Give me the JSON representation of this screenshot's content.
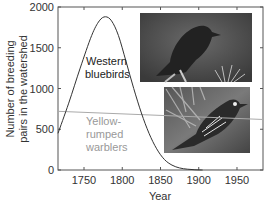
{
  "chart_data": {
    "type": "line",
    "title": "",
    "xlabel": "Year",
    "ylabel": "Number of breeding pairs in the watershed",
    "ylabel_lines": [
      "Number of breeding",
      "pairs in the watershed"
    ],
    "xlim": [
      1716,
      1984
    ],
    "ylim": [
      0,
      2000
    ],
    "xticks": [
      1750,
      1800,
      1850,
      1900,
      1950
    ],
    "yticks": [
      0,
      500,
      1000,
      1500,
      2000
    ],
    "grid": false,
    "series": [
      {
        "name": "Western bluebirds",
        "label_lines": [
          "Western",
          "bluebirds"
        ],
        "color": "#333333",
        "x": [
          1716,
          1730,
          1745,
          1760,
          1770,
          1778,
          1786,
          1795,
          1805,
          1815,
          1825,
          1835,
          1845,
          1855,
          1865,
          1875,
          1885,
          1895,
          1905
        ],
        "y": [
          450,
          820,
          1250,
          1650,
          1830,
          1880,
          1830,
          1650,
          1330,
          1000,
          700,
          450,
          260,
          130,
          60,
          25,
          10,
          3,
          0
        ]
      },
      {
        "name": "Yellow-rumped warblers",
        "label_lines": [
          "Yellow-",
          "rumped",
          "warblers"
        ],
        "color": "#aaaaaa",
        "x": [
          1716,
          1984
        ],
        "y": [
          720,
          620
        ]
      }
    ],
    "images": [
      {
        "name": "western-bluebird-photo"
      },
      {
        "name": "yellow-rumped-warbler-photo"
      }
    ]
  }
}
